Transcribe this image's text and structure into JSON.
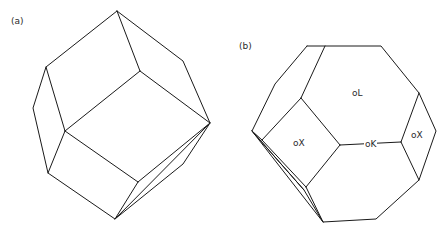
{
  "figure": {
    "panels": [
      {
        "id": "a",
        "label": "(a)",
        "shape": "rhombic dodecahedron"
      },
      {
        "id": "b",
        "label": "(b)",
        "shape": "truncated octahedron"
      }
    ],
    "face_labels": {
      "oL": "oL",
      "oX_left": "oX",
      "oK": "oK",
      "oX_right": "oX"
    },
    "colors": {
      "line": "#1a1a1a",
      "background": "#ffffff",
      "text": "#2a2a2a"
    }
  }
}
